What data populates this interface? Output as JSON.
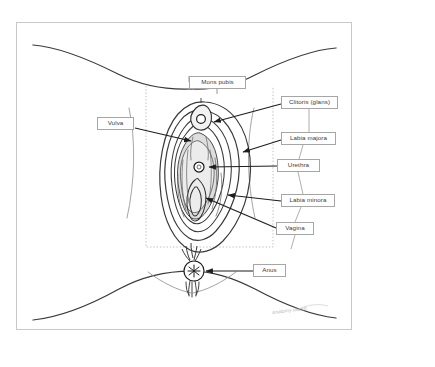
{
  "page": {
    "background_color": "#ffffff",
    "frame_color": "#c9c9c9",
    "ink_color": "#333333",
    "shading_color": "#d8d8d8",
    "selection_color": "#bfbfbf"
  },
  "diagram": {
    "signature": "anatomy sketch"
  },
  "labels": {
    "mons_pubis": "Mons pubis",
    "vulva": "Vulva",
    "clitoris_glans": "Clitoris (glans)",
    "labia_majora": "Labia majora",
    "urethra": "Urethra",
    "labia_minora": "Labia minora",
    "vagina": "Vagina",
    "anus": "Anus"
  }
}
